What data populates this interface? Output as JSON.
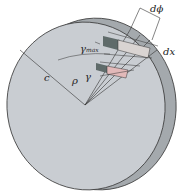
{
  "figure": {
    "labels": {
      "d_phi": "dϕ",
      "dx": "dx",
      "gamma_max": "γ",
      "gamma_max_sub": "max",
      "c": "c",
      "rho": "ρ",
      "gamma": "γ"
    },
    "colors": {
      "face": "#c9cdd2",
      "rim": "#a4a9ad",
      "rim_dark": "#8d9296",
      "outline": "#3a3a3a",
      "element_dark": "#5f6b6a",
      "element_light": "#d9d4d2",
      "element_pink": "#e2b9b9"
    }
  }
}
